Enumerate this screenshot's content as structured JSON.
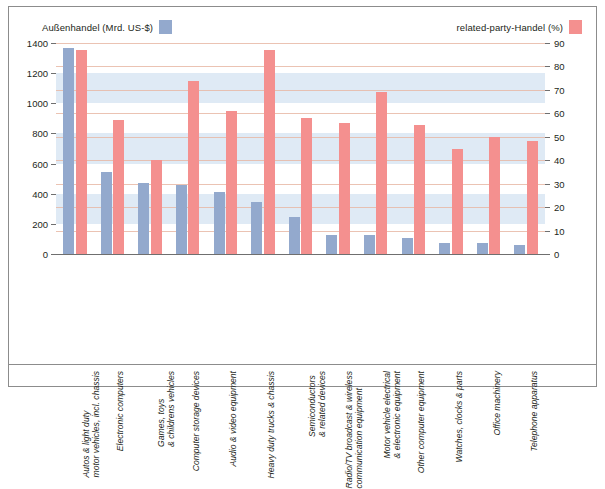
{
  "legend": {
    "left": {
      "label": "Außenhandel (Mrd. US-$)",
      "color": "#93a9cd"
    },
    "right": {
      "label": "related-party-Handel (%)",
      "color": "#f4908f"
    }
  },
  "chart_data": {
    "type": "bar",
    "title": "",
    "xlabel": "",
    "grid": true,
    "legend_position": "top",
    "categories": [
      "Autos & light duty\nmotor vehicles, incl. chassis",
      "Electronic computers",
      "Games, toys\n& childrens vehicles",
      "Computer storage devices",
      "Audio & video equipment",
      "Heavy duty trucks & chassis",
      "Semiconductors\n& related devices",
      "Radio/TV broadcast & wireless\ncommunication equipment",
      "Motor vehicle electrical\n& electronic equipment",
      "Other computer equipment",
      "Watches, clocks & parts",
      "Office machinery",
      "Telephone apparatus"
    ],
    "category_lines": [
      [
        "Autos & light duty",
        "motor vehicles, incl. chassis"
      ],
      [
        "Electronic computers"
      ],
      [
        "Games, toys",
        "& childrens vehicles"
      ],
      [
        "Computer storage devices"
      ],
      [
        "Audio & video equipment"
      ],
      [
        "Heavy duty trucks & chassis"
      ],
      [
        "Semiconductors",
        "& related devices"
      ],
      [
        "Radio/TV broadcast & wireless",
        "communication equipment"
      ],
      [
        "Motor vehicle electrical",
        "& electronic equipment"
      ],
      [
        "Other computer equipment"
      ],
      [
        "Watches, clocks & parts"
      ],
      [
        "Office machinery"
      ],
      [
        "Telephone apparatus"
      ]
    ],
    "series": [
      {
        "name": "Außenhandel (Mrd. US-$)",
        "axis": "left",
        "unit": "Mrd. US-$",
        "color": "#93a9cd",
        "values": [
          1370,
          545,
          470,
          455,
          410,
          345,
          245,
          125,
          125,
          105,
          75,
          70,
          60
        ]
      },
      {
        "name": "related-party-Handel (%)",
        "axis": "right",
        "unit": "%",
        "color": "#f4908f",
        "values": [
          87,
          57,
          40,
          74,
          61,
          87,
          58,
          56,
          69,
          55,
          45,
          50,
          48
        ]
      }
    ],
    "left_axis": {
      "label": "Außenhandel (Mrd. US-$)",
      "ticks": [
        0,
        200,
        400,
        600,
        800,
        1000,
        1200,
        1400
      ],
      "ylim": [
        0,
        1400
      ]
    },
    "right_axis": {
      "label": "related-party-Handel (%)",
      "ticks": [
        0,
        10,
        20,
        30,
        40,
        50,
        60,
        70,
        80,
        90
      ],
      "ylim": [
        0,
        90
      ]
    }
  },
  "style": {
    "band_color": "#dfeaf5",
    "gridline_color": "#e8b9a6",
    "axis_color": "#6f6f6f",
    "frame_color": "#8c8c8c"
  }
}
